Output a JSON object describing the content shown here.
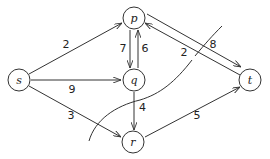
{
  "diagram": {
    "type": "flow-network",
    "nodes": [
      {
        "id": "s",
        "label": "s",
        "x": 19,
        "y": 80
      },
      {
        "id": "p",
        "label": "p",
        "x": 134,
        "y": 18
      },
      {
        "id": "q",
        "label": "q",
        "x": 134,
        "y": 80
      },
      {
        "id": "r",
        "label": "r",
        "x": 133,
        "y": 142
      },
      {
        "id": "t",
        "label": "t",
        "x": 250,
        "y": 80
      }
    ],
    "edges": [
      {
        "from": "s",
        "to": "p",
        "capacity": "2"
      },
      {
        "from": "s",
        "to": "q",
        "capacity": "9"
      },
      {
        "from": "s",
        "to": "r",
        "capacity": "3"
      },
      {
        "from": "p",
        "to": "q",
        "capacity": "7"
      },
      {
        "from": "q",
        "to": "p",
        "capacity": "6"
      },
      {
        "from": "p",
        "to": "t",
        "capacity": "8"
      },
      {
        "from": "t",
        "to": "p",
        "capacity": "2"
      },
      {
        "from": "q",
        "to": "r",
        "capacity": "4"
      },
      {
        "from": "r",
        "to": "t",
        "capacity": "5"
      }
    ],
    "cut": {
      "description": "curved cut line separating s,p,q from r,t region"
    },
    "colors": {
      "stroke": "#333333",
      "background": "#ffffff"
    }
  }
}
